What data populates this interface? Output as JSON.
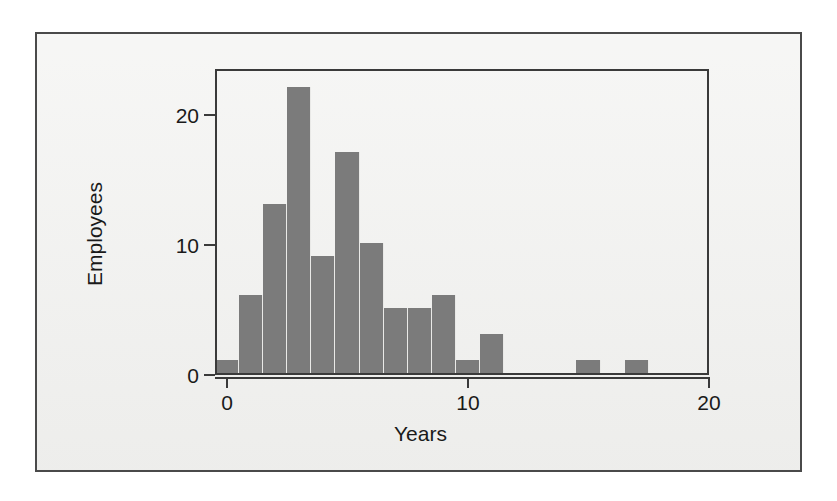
{
  "figure": {
    "background_color": "#f2f2f0",
    "frame_color": "#4a4a4a",
    "bar_color": "#7b7b7b",
    "axis_color": "#3a3a3a"
  },
  "chart_data": {
    "type": "bar",
    "title": "",
    "xlabel": "Years",
    "ylabel": "Employees",
    "xlim": [
      -0.5,
      20.0
    ],
    "ylim": [
      0,
      23.5
    ],
    "grid": false,
    "legend": null,
    "bin_width": 1,
    "x_ticks": [
      0,
      10,
      20
    ],
    "x_tick_labels": [
      "0",
      "10",
      "20"
    ],
    "y_ticks": [
      0,
      10,
      20
    ],
    "y_tick_labels": [
      "0",
      "10",
      "20"
    ],
    "categories": [
      0,
      1,
      2,
      3,
      4,
      5,
      6,
      7,
      8,
      9,
      10,
      11,
      12,
      13,
      14,
      15,
      16,
      17
    ],
    "values": [
      1,
      6,
      13,
      22,
      9,
      17,
      10,
      5,
      5,
      6,
      1,
      3,
      0,
      0,
      0,
      1,
      0,
      1
    ],
    "bars": [
      {
        "x": 0,
        "value": 1,
        "label": "0"
      },
      {
        "x": 1,
        "value": 6,
        "label": "1"
      },
      {
        "x": 2,
        "value": 13,
        "label": "2"
      },
      {
        "x": 3,
        "value": 22,
        "label": "3"
      },
      {
        "x": 4,
        "value": 9,
        "label": "4"
      },
      {
        "x": 5,
        "value": 17,
        "label": "5"
      },
      {
        "x": 6,
        "value": 10,
        "label": "6"
      },
      {
        "x": 7,
        "value": 5,
        "label": "7"
      },
      {
        "x": 8,
        "value": 5,
        "label": "8"
      },
      {
        "x": 9,
        "value": 6,
        "label": "9"
      },
      {
        "x": 10,
        "value": 1,
        "label": "10"
      },
      {
        "x": 11,
        "value": 3,
        "label": "11"
      },
      {
        "x": 12,
        "value": 0,
        "label": "12"
      },
      {
        "x": 13,
        "value": 0,
        "label": "13"
      },
      {
        "x": 14,
        "value": 0,
        "label": "14"
      },
      {
        "x": 15,
        "value": 1,
        "label": "15"
      },
      {
        "x": 16,
        "value": 0,
        "label": "16"
      },
      {
        "x": 17,
        "value": 1,
        "label": "17"
      }
    ]
  }
}
